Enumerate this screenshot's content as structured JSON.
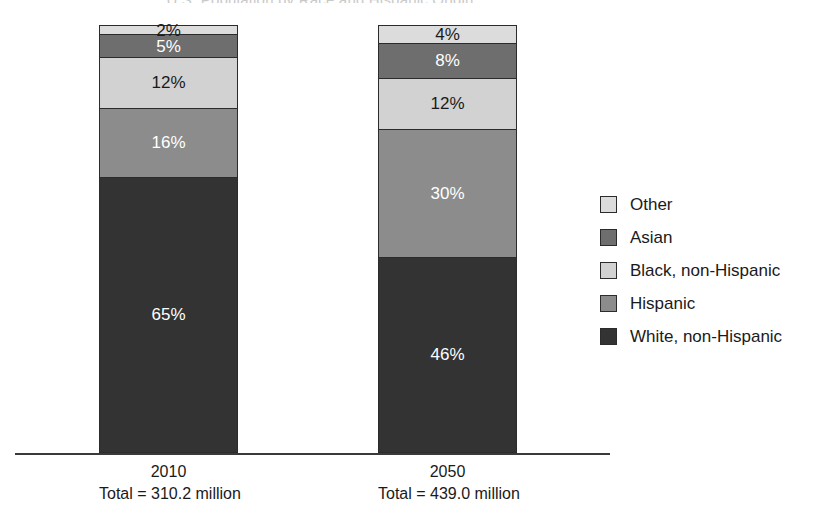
{
  "chart_data": {
    "type": "bar",
    "subtype": "100% stacked column",
    "title": "U.S. Population by Race and Hispanic Origin",
    "xlabel": "",
    "ylabel": "",
    "ylim": [
      0,
      100
    ],
    "grid": false,
    "legend_position": "right",
    "categories": [
      "2010",
      "2050"
    ],
    "category_sublabels": [
      "Total = 310.2 million",
      "Total = 439.0 million"
    ],
    "category_totals_millions": [
      310.2,
      439.0
    ],
    "stack_order_bottom_to_top": [
      "White, non-Hispanic",
      "Hispanic",
      "Black, non-Hispanic",
      "Asian",
      "Other"
    ],
    "series": [
      {
        "name": "Other",
        "color": "#dcdcdc",
        "label_color": "dark",
        "values": [
          2,
          4
        ],
        "data_labels": [
          "2%",
          "4%"
        ]
      },
      {
        "name": "Asian",
        "color": "#6e6e6e",
        "label_color": "light",
        "values": [
          5,
          8
        ],
        "data_labels": [
          "5%",
          "8%"
        ]
      },
      {
        "name": "Black, non-Hispanic",
        "color": "#d2d2d2",
        "label_color": "dark",
        "values": [
          12,
          12
        ],
        "data_labels": [
          "12%",
          "12%"
        ]
      },
      {
        "name": "Hispanic",
        "color": "#8c8c8c",
        "label_color": "light",
        "values": [
          16,
          30
        ],
        "data_labels": [
          "16%",
          "30%"
        ]
      },
      {
        "name": "White, non-Hispanic",
        "color": "#333333",
        "label_color": "light",
        "values": [
          65,
          46
        ],
        "data_labels": [
          "65%",
          "46%"
        ]
      }
    ]
  },
  "legend": {
    "items": [
      {
        "label": "Other",
        "color": "#dcdcdc"
      },
      {
        "label": "Asian",
        "color": "#6e6e6e"
      },
      {
        "label": "Black, non-Hispanic",
        "color": "#d2d2d2"
      },
      {
        "label": "Hispanic",
        "color": "#8c8c8c"
      },
      {
        "label": "White, non-Hispanic",
        "color": "#333333"
      }
    ]
  },
  "axis": {
    "baseline_color": "#3a3a3a"
  },
  "bars": [
    {
      "category": "2010",
      "sublabel": "Total = 310.2 million",
      "segments": [
        {
          "name": "Other",
          "pct": 2,
          "label": "2%",
          "color": "#dcdcdc",
          "text": "dark"
        },
        {
          "name": "Asian",
          "pct": 5,
          "label": "5%",
          "color": "#6e6e6e",
          "text": "light"
        },
        {
          "name": "Black, non-Hispanic",
          "pct": 12,
          "label": "12%",
          "color": "#d2d2d2",
          "text": "dark"
        },
        {
          "name": "Hispanic",
          "pct": 16,
          "label": "16%",
          "color": "#8c8c8c",
          "text": "light"
        },
        {
          "name": "White, non-Hispanic",
          "pct": 65,
          "label": "65%",
          "color": "#333333",
          "text": "light"
        }
      ]
    },
    {
      "category": "2050",
      "sublabel": "Total = 439.0 million",
      "segments": [
        {
          "name": "Other",
          "pct": 4,
          "label": "4%",
          "color": "#dcdcdc",
          "text": "dark"
        },
        {
          "name": "Asian",
          "pct": 8,
          "label": "8%",
          "color": "#6e6e6e",
          "text": "light"
        },
        {
          "name": "Black, non-Hispanic",
          "pct": 12,
          "label": "12%",
          "color": "#d2d2d2",
          "text": "dark"
        },
        {
          "name": "Hispanic",
          "pct": 30,
          "label": "30%",
          "color": "#8c8c8c",
          "text": "light"
        },
        {
          "name": "White, non-Hispanic",
          "pct": 46,
          "label": "46%",
          "color": "#333333",
          "text": "light"
        }
      ]
    }
  ]
}
